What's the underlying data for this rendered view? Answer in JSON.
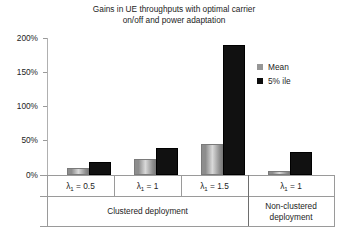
{
  "chart_data": {
    "type": "bar",
    "xlabel": "",
    "ylabel": "",
    "ylim": [
      0,
      200
    ],
    "ytick_labels": [
      "200%",
      "150%",
      "100%",
      "50%",
      "0%"
    ],
    "ytick_values": [
      200,
      150,
      100,
      50,
      0
    ],
    "grid": false,
    "legend_position": "upper-right-inside",
    "categories": [
      "λ₁ = 0.5",
      "λ₁ = 1",
      "λ₁ = 1.5",
      "λ₁ = 1"
    ],
    "group_labels": [
      "Clustered deployment",
      "Clustered deployment",
      "Clustered deployment",
      "Non-clustered\ndeployment"
    ],
    "series": [
      {
        "name": "Mean",
        "color": "#969696",
        "values": [
          7,
          20,
          42,
          3
        ]
      },
      {
        "name": "5% ile",
        "color": "#0d0d0d",
        "values": [
          16,
          36,
          187,
          31
        ]
      }
    ]
  },
  "chart": {
    "title_line1": "Gains in UE throughputs with optimal carrier",
    "title_line2": "on/off and power adaptation",
    "yticks": [
      {
        "label": "200%",
        "value": 200
      },
      {
        "label": "150%",
        "value": 150
      },
      {
        "label": "100%",
        "value": 100
      },
      {
        "label": "50%",
        "value": 50
      },
      {
        "label": "0%",
        "value": 0
      }
    ]
  },
  "legend": {
    "items": [
      {
        "label": "Mean",
        "swatch_color": "#969696"
      },
      {
        "label": "5% ile",
        "swatch_color": "#0d0d0d"
      }
    ]
  },
  "axis_table": {
    "lambda_symbol": "λ",
    "lambda_subscript": "1",
    "groups": [
      {
        "lambda_value": " = 0.5",
        "deployment": "Clustered deployment"
      },
      {
        "lambda_value": " = 1",
        "deployment": ""
      },
      {
        "lambda_value": " = 1.5",
        "deployment": ""
      },
      {
        "lambda_value": " = 1",
        "deployment": "Non-clustered\ndeployment"
      }
    ],
    "clustered_label": "Clustered deployment",
    "nonclustered_label": "Non-clustered\ndeployment"
  }
}
